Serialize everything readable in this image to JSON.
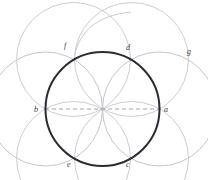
{
  "figure": {
    "canvas": {
      "width": 208,
      "height": 180,
      "background": "#ffffff"
    },
    "colors": {
      "main_circle": "#2b2b33",
      "construction_arc": "#b8b8c0",
      "construction_arc_light": "#c9c9d0",
      "dashed_axis": "#9a9aa4",
      "label_text": "#3a3a42"
    },
    "labels": [
      {
        "id": "a",
        "text": "a",
        "x": 164,
        "y": 112,
        "role": "right-intersection-point"
      },
      {
        "id": "b",
        "text": "b",
        "x": 36,
        "y": 112,
        "role": "left-intersection-point"
      },
      {
        "id": "c",
        "text": "c",
        "x": 126,
        "y": 162,
        "role": "lower-right-point"
      },
      {
        "id": "d",
        "text": "d",
        "x": 126,
        "y": 46,
        "role": "upper-right-point"
      },
      {
        "id": "e",
        "text": "e",
        "x": 68,
        "y": 162,
        "role": "lower-left-point"
      },
      {
        "id": "f",
        "text": "f",
        "x": 65,
        "y": 44,
        "role": "upper-left-point"
      },
      {
        "id": "g",
        "text": "g",
        "x": 188,
        "y": 50,
        "role": "outer-right-point"
      }
    ],
    "geometry": {
      "main_circle": {
        "cx": 102.5,
        "cy": 109,
        "r": 57,
        "stroke_width": 2.0
      },
      "axis_line": {
        "x1": 45,
        "y1": 109,
        "x2": 161,
        "y2": 109,
        "dash": "4,3"
      },
      "construction_circles": [
        {
          "name": "left-circle",
          "cx": 45.5,
          "cy": 109,
          "r": 57
        },
        {
          "name": "right-circle",
          "cx": 159.5,
          "cy": 109,
          "r": 57
        },
        {
          "name": "upper-left-petal-circle",
          "cx": 73.5,
          "cy": 60,
          "r": 57
        },
        {
          "name": "upper-right-petal-circle",
          "cx": 131,
          "cy": 60,
          "r": 57
        },
        {
          "name": "lower-left-petal-circle",
          "cx": 73.5,
          "cy": 158,
          "r": 57
        },
        {
          "name": "lower-right-petal-circle",
          "cx": 131,
          "cy": 158,
          "r": 57
        }
      ],
      "outer_arc": {
        "name": "upper-sweep-arc",
        "cx": 131,
        "cy": 60,
        "r": 57
      }
    }
  }
}
